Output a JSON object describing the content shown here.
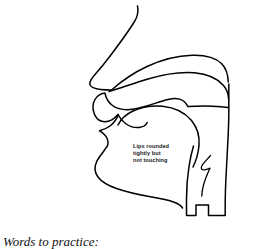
{
  "page": {
    "background_color": "#ffffff",
    "line_color": "#000000",
    "text_color": "#1a1a1a"
  },
  "diagram": {
    "name": "vocal-tract-sagittal-section",
    "parts": [
      "nose-bridge",
      "nostril",
      "nasal-cavity",
      "hard-palate",
      "soft-palate",
      "upper-lip",
      "lower-lip",
      "tongue",
      "chin",
      "uvula",
      "epiglottis",
      "pharynx",
      "back-of-neck"
    ]
  },
  "annotation": {
    "name": "lips-annotation",
    "lines": [
      "Lips rounded",
      "tightly but",
      "not touching"
    ],
    "line1": "Lips rounded",
    "line2": "tightly but",
    "line3": "not touching"
  },
  "caption": {
    "text": "Words to practice:"
  }
}
